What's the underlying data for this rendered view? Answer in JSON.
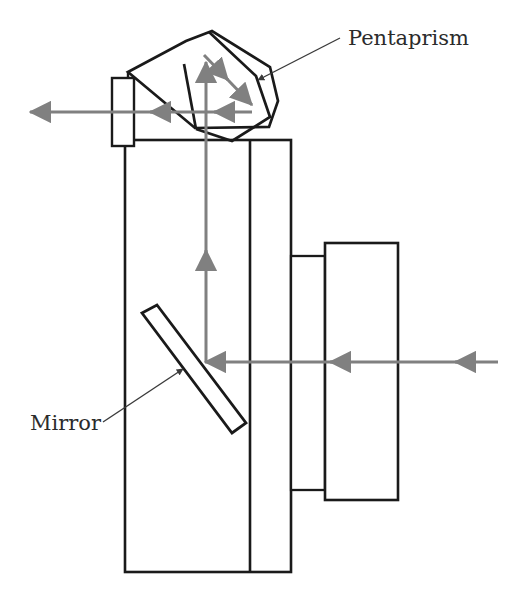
{
  "diagram": {
    "type": "optical-schematic",
    "background_color": "#ffffff",
    "outline_color": "#1a1a1a",
    "ray_color": "#808080",
    "leader_color": "#3a3a3a",
    "label_color": "#2b2b2b",
    "labels": {
      "pentaprism": "Pentaprism",
      "mirror": "Mirror"
    },
    "parts": [
      {
        "name": "pentaprism",
        "label": "Pentaprism",
        "shape": "tilted-polygon",
        "points": "128,72 185,41 211,32 268,66 277,100 270,126 200,127 186,130"
      },
      {
        "name": "pentaprism-inner-face",
        "label": "",
        "shape": "polyline",
        "points": "184,65 194,128"
      },
      {
        "name": "pentaprism-roof-edge",
        "label": "",
        "shape": "polyline",
        "points": "208,33 254,75 269,117 232,141 196,128"
      },
      {
        "name": "camera-body",
        "label": "",
        "shape": "rect",
        "points": "125,140 291,140 291,572 125,572"
      },
      {
        "name": "body-divider",
        "label": "",
        "shape": "line",
        "points": "250,140 250,572"
      },
      {
        "name": "eyepiece",
        "label": "",
        "shape": "rect",
        "points": "112,78 134,78 134,146 112,146"
      },
      {
        "name": "lens-inner-barrel",
        "label": "",
        "shape": "rect",
        "points": "291,256 325,256 325,490 291,490"
      },
      {
        "name": "lens-outer-barrel",
        "label": "",
        "shape": "rect",
        "points": "325,243 398,243 398,500 325,500"
      },
      {
        "name": "mirror",
        "label": "Mirror",
        "shape": "tilted-bar",
        "points": "142,313 157,306 245,423 232,433"
      }
    ],
    "rays": [
      {
        "name": "incoming-ray",
        "direction": "leftward",
        "from": "scene (right edge)",
        "to": "mirror",
        "y": 362
      },
      {
        "name": "reflected-vertical-ray",
        "direction": "upward",
        "from": "mirror",
        "to": "pentaprism",
        "x": 206
      },
      {
        "name": "pentaprism-diagonal-ray",
        "direction": "down-right",
        "from": "prism top",
        "to": "prism face"
      },
      {
        "name": "viewfinder-exit-ray",
        "direction": "leftward",
        "from": "pentaprism",
        "to": "eyepiece",
        "y": 112
      }
    ]
  }
}
